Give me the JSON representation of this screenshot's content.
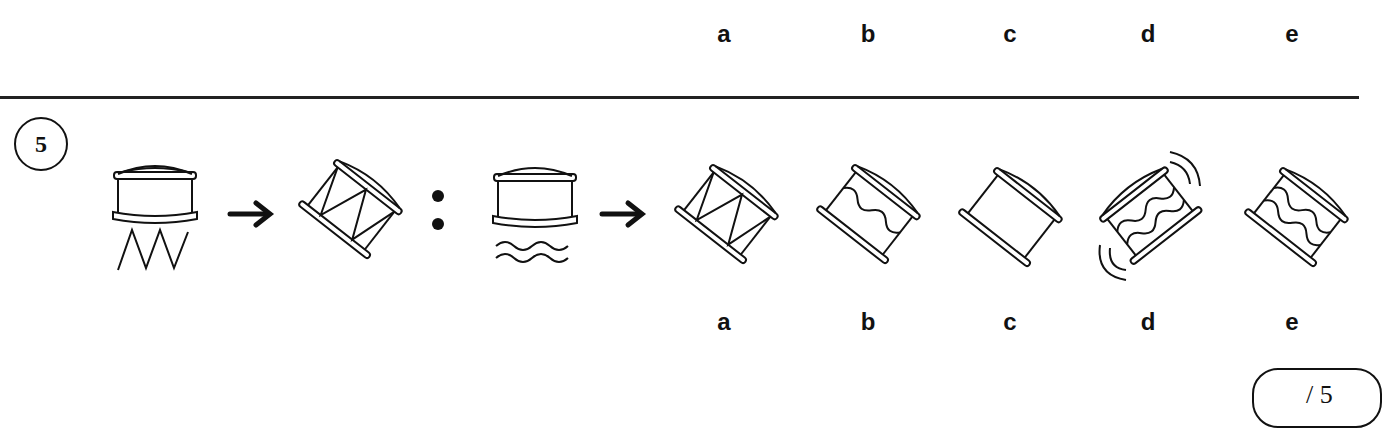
{
  "top_row": {
    "option_labels": [
      "a",
      "b",
      "c",
      "d",
      "e"
    ]
  },
  "question": {
    "number": "5",
    "premise": {
      "source_icon": "drum-upright-zigzag",
      "target_icon": "drum-tilted-zigzag"
    },
    "analogy_separator": ":",
    "query": {
      "source_icon": "drum-upright-waves"
    },
    "options": [
      {
        "label": "a",
        "icon": "drum-tilted-zigzag-pattern"
      },
      {
        "label": "b",
        "icon": "drum-tilted-single-wave"
      },
      {
        "label": "c",
        "icon": "drum-tilted-plain"
      },
      {
        "label": "d",
        "icon": "drum-tilted-double-wave-vibrating"
      },
      {
        "label": "e",
        "icon": "drum-tilted-double-wave"
      }
    ]
  },
  "score": {
    "text": "/ 5"
  }
}
